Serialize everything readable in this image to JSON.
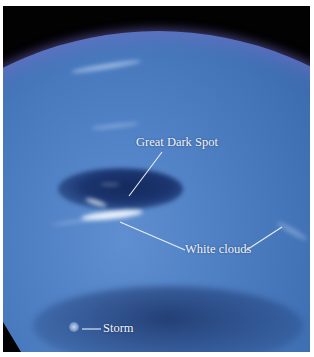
{
  "image": {
    "subject": "Neptune",
    "colors": {
      "frame": "#ffffff",
      "space": "#020203",
      "planet_blue": "#3f6fb3",
      "label_text": "#f4f6fb"
    }
  },
  "annotations": {
    "great_dark_spot": {
      "label": "Great Dark Spot"
    },
    "white_clouds": {
      "label": "White clouds"
    },
    "storm": {
      "label": "Storm"
    }
  }
}
